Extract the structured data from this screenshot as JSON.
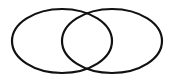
{
  "diagram": {
    "type": "venn",
    "sets": [
      {
        "name": "left-set",
        "cx": 62,
        "cy": 41,
        "rx": 50,
        "ry": 32
      },
      {
        "name": "right-set",
        "cx": 112,
        "cy": 41,
        "rx": 50,
        "ry": 32
      }
    ],
    "stroke": "#111111",
    "stroke_width": 2.2,
    "background": "#ffffff"
  }
}
